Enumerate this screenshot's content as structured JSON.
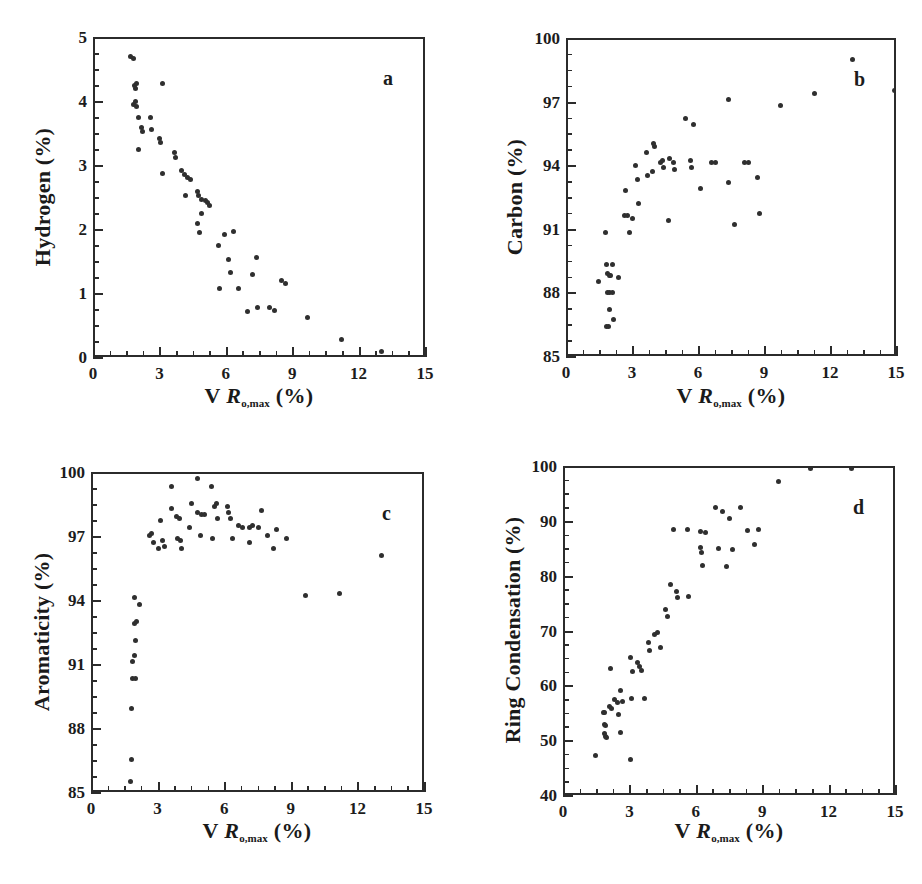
{
  "figure": {
    "panels": [
      {
        "letter": "a",
        "x_title_prefix": "V ",
        "x_title_symbol": "R",
        "x_title_sub": "o,max",
        "x_title_suffix": " (%)",
        "y_title": "Hydrogen (%)",
        "x_ticks": [
          "0",
          "3",
          "6",
          "9",
          "12",
          "15"
        ],
        "y_ticks": [
          "0",
          "1",
          "2",
          "3",
          "4",
          "5"
        ]
      },
      {
        "letter": "b",
        "x_title_prefix": "V ",
        "x_title_symbol": "R",
        "x_title_sub": "o,max",
        "x_title_suffix": " (%)",
        "y_title": "Carbon (%)",
        "x_ticks": [
          "0",
          "3",
          "6",
          "9",
          "12",
          "15"
        ],
        "y_ticks": [
          "85",
          "88",
          "91",
          "94",
          "97",
          "100"
        ]
      },
      {
        "letter": "c",
        "x_title_prefix": "V ",
        "x_title_symbol": "R",
        "x_title_sub": "o,max",
        "x_title_suffix": " (%)",
        "y_title": "Aromaticity (%)",
        "x_ticks": [
          "0",
          "3",
          "6",
          "9",
          "12",
          "15"
        ],
        "y_ticks": [
          "85",
          "88",
          "91",
          "94",
          "97",
          "100"
        ]
      },
      {
        "letter": "d",
        "x_title_prefix": "V ",
        "x_title_symbol": "R",
        "x_title_sub": "o,max",
        "x_title_suffix": " (%)",
        "y_title": "Ring Condensation (%)",
        "x_ticks": [
          "0",
          "3",
          "6",
          "9",
          "12",
          "15"
        ],
        "y_ticks": [
          "40",
          "50",
          "60",
          "70",
          "80",
          "90",
          "100"
        ]
      }
    ],
    "marker_color": "#2f2f2f",
    "axis_color": "#2b2b2b"
  },
  "chart_data": [
    {
      "type": "scatter",
      "panel": "a",
      "title": "",
      "xlabel": "V Ro,max (%)",
      "ylabel": "Hydrogen (%)",
      "xlim": [
        0,
        15
      ],
      "ylim": [
        0,
        5
      ],
      "xticks": [
        0,
        3,
        6,
        9,
        12,
        15
      ],
      "yticks": [
        0,
        1,
        2,
        3,
        4,
        5
      ],
      "x_minor_tick_step": 0.75,
      "y_minor_tick_step": 0.25,
      "grid": false,
      "legend": false,
      "points": [
        [
          1.62,
          4.72
        ],
        [
          1.75,
          4.7
        ],
        [
          1.8,
          4.28
        ],
        [
          1.82,
          4.22
        ],
        [
          1.86,
          4.3
        ],
        [
          3.05,
          4.3
        ],
        [
          1.72,
          3.97
        ],
        [
          1.82,
          4.02
        ],
        [
          1.88,
          3.95
        ],
        [
          1.95,
          3.78
        ],
        [
          2.52,
          3.77
        ],
        [
          2.1,
          3.62
        ],
        [
          2.55,
          3.58
        ],
        [
          2.15,
          3.55
        ],
        [
          2.92,
          3.45
        ],
        [
          2.96,
          3.38
        ],
        [
          1.95,
          3.28
        ],
        [
          3.6,
          3.22
        ],
        [
          3.62,
          3.15
        ],
        [
          3.05,
          2.9
        ],
        [
          3.92,
          2.95
        ],
        [
          4.05,
          2.88
        ],
        [
          4.18,
          2.83
        ],
        [
          4.32,
          2.8
        ],
        [
          4.65,
          2.62
        ],
        [
          4.68,
          2.55
        ],
        [
          4.1,
          2.55
        ],
        [
          4.82,
          2.5
        ],
        [
          5.0,
          2.48
        ],
        [
          5.1,
          2.44
        ],
        [
          5.18,
          2.4
        ],
        [
          4.8,
          2.28
        ],
        [
          4.62,
          2.12
        ],
        [
          4.72,
          1.98
        ],
        [
          5.85,
          1.95
        ],
        [
          6.28,
          2.0
        ],
        [
          5.58,
          1.78
        ],
        [
          6.05,
          1.55
        ],
        [
          7.28,
          1.58
        ],
        [
          6.1,
          1.35
        ],
        [
          7.12,
          1.32
        ],
        [
          8.42,
          1.22
        ],
        [
          8.62,
          1.18
        ],
        [
          5.62,
          1.1
        ],
        [
          6.5,
          1.1
        ],
        [
          6.9,
          0.75
        ],
        [
          7.32,
          0.8
        ],
        [
          7.9,
          0.8
        ],
        [
          8.1,
          0.76
        ],
        [
          9.62,
          0.65
        ],
        [
          11.15,
          0.3
        ],
        [
          12.95,
          0.12
        ]
      ]
    },
    {
      "type": "scatter",
      "panel": "b",
      "title": "",
      "xlabel": "V Ro,max (%)",
      "ylabel": "Carbon (%)",
      "xlim": [
        0,
        15
      ],
      "ylim": [
        85,
        100
      ],
      "xticks": [
        0,
        3,
        6,
        9,
        12,
        15
      ],
      "yticks": [
        85,
        88,
        91,
        94,
        97,
        100
      ],
      "x_minor_tick_step": 0.75,
      "y_minor_tick_step": 0.75,
      "grid": false,
      "legend": false,
      "points": [
        [
          1.4,
          88.6
        ],
        [
          1.72,
          90.9
        ],
        [
          1.75,
          89.4
        ],
        [
          2.0,
          89.4
        ],
        [
          1.8,
          89.0
        ],
        [
          1.88,
          88.9
        ],
        [
          1.95,
          88.9
        ],
        [
          1.78,
          88.1
        ],
        [
          1.9,
          88.1
        ],
        [
          2.0,
          88.1
        ],
        [
          1.88,
          87.3
        ],
        [
          1.75,
          86.5
        ],
        [
          1.85,
          86.5
        ],
        [
          2.05,
          86.8
        ],
        [
          2.3,
          88.8
        ],
        [
          2.55,
          91.7
        ],
        [
          2.7,
          91.7
        ],
        [
          2.92,
          91.6
        ],
        [
          2.62,
          92.9
        ],
        [
          2.8,
          90.9
        ],
        [
          3.05,
          94.1
        ],
        [
          3.15,
          93.4
        ],
        [
          3.2,
          92.3
        ],
        [
          3.55,
          94.7
        ],
        [
          3.62,
          93.6
        ],
        [
          3.82,
          93.8
        ],
        [
          3.9,
          95.1
        ],
        [
          3.95,
          95.0
        ],
        [
          4.2,
          94.2
        ],
        [
          4.28,
          94.3
        ],
        [
          4.35,
          94.0
        ],
        [
          4.62,
          94.4
        ],
        [
          4.78,
          94.2
        ],
        [
          4.85,
          93.9
        ],
        [
          4.55,
          91.5
        ],
        [
          5.35,
          96.3
        ],
        [
          5.55,
          94.3
        ],
        [
          5.7,
          96.0
        ],
        [
          5.6,
          94.0
        ],
        [
          6.0,
          93.0
        ],
        [
          6.52,
          94.2
        ],
        [
          6.7,
          94.2
        ],
        [
          7.3,
          97.2
        ],
        [
          7.3,
          93.3
        ],
        [
          7.55,
          91.3
        ],
        [
          8.0,
          94.2
        ],
        [
          8.2,
          94.2
        ],
        [
          8.62,
          93.5
        ],
        [
          8.72,
          91.8
        ],
        [
          9.65,
          96.9
        ],
        [
          11.2,
          97.5
        ],
        [
          12.95,
          99.1
        ],
        [
          14.85,
          97.6
        ]
      ]
    },
    {
      "type": "scatter",
      "panel": "c",
      "title": "",
      "xlabel": "V Ro,max (%)",
      "ylabel": "Aromaticity (%)",
      "xlim": [
        0,
        15
      ],
      "ylim": [
        85,
        100
      ],
      "xticks": [
        0,
        3,
        6,
        9,
        12,
        15
      ],
      "yticks": [
        85,
        88,
        91,
        94,
        97,
        100
      ],
      "x_minor_tick_step": 0.75,
      "y_minor_tick_step": 0.75,
      "grid": false,
      "legend": false,
      "points": [
        [
          1.7,
          85.6
        ],
        [
          1.72,
          86.6
        ],
        [
          1.75,
          89.0
        ],
        [
          1.78,
          90.4
        ],
        [
          1.92,
          90.4
        ],
        [
          1.8,
          91.2
        ],
        [
          1.85,
          91.5
        ],
        [
          1.9,
          92.2
        ],
        [
          1.88,
          93.0
        ],
        [
          1.95,
          93.1
        ],
        [
          1.85,
          94.2
        ],
        [
          2.1,
          93.9
        ],
        [
          2.55,
          97.1
        ],
        [
          2.62,
          97.2
        ],
        [
          2.72,
          96.8
        ],
        [
          2.95,
          96.5
        ],
        [
          3.05,
          97.8
        ],
        [
          3.15,
          96.9
        ],
        [
          3.22,
          96.6
        ],
        [
          3.52,
          99.4
        ],
        [
          3.55,
          98.4
        ],
        [
          3.78,
          98.0
        ],
        [
          3.88,
          97.9
        ],
        [
          3.82,
          97.0
        ],
        [
          3.92,
          96.9
        ],
        [
          3.98,
          96.5
        ],
        [
          4.45,
          98.6
        ],
        [
          4.35,
          97.5
        ],
        [
          4.7,
          99.8
        ],
        [
          4.72,
          98.2
        ],
        [
          4.9,
          98.1
        ],
        [
          5.0,
          98.1
        ],
        [
          4.82,
          97.1
        ],
        [
          5.35,
          99.4
        ],
        [
          5.48,
          98.5
        ],
        [
          5.55,
          98.6
        ],
        [
          5.6,
          97.9
        ],
        [
          5.38,
          97.0
        ],
        [
          6.05,
          98.5
        ],
        [
          6.1,
          98.2
        ],
        [
          6.18,
          97.9
        ],
        [
          6.3,
          97.0
        ],
        [
          6.55,
          97.6
        ],
        [
          6.72,
          97.5
        ],
        [
          7.05,
          97.5
        ],
        [
          7.2,
          97.6
        ],
        [
          7.05,
          96.8
        ],
        [
          7.6,
          98.3
        ],
        [
          7.45,
          97.5
        ],
        [
          7.85,
          97.1
        ],
        [
          8.25,
          97.4
        ],
        [
          8.15,
          96.5
        ],
        [
          8.7,
          97.0
        ],
        [
          9.55,
          94.3
        ],
        [
          11.1,
          94.4
        ],
        [
          13.0,
          96.2
        ]
      ]
    },
    {
      "type": "scatter",
      "panel": "d",
      "title": "",
      "xlabel": "V Ro,max (%)",
      "ylabel": "Ring Condensation (%)",
      "xlim": [
        0,
        15
      ],
      "ylim": [
        40,
        100
      ],
      "xticks": [
        0,
        3,
        6,
        9,
        12,
        15
      ],
      "yticks": [
        40,
        50,
        60,
        70,
        80,
        90,
        100
      ],
      "x_minor_tick_step": 0.75,
      "y_minor_tick_step": 2.5,
      "grid": false,
      "legend": false,
      "points": [
        [
          1.4,
          47.5
        ],
        [
          1.72,
          55.5
        ],
        [
          1.8,
          55.4
        ],
        [
          1.78,
          53.2
        ],
        [
          1.85,
          53.0
        ],
        [
          1.8,
          51.6
        ],
        [
          1.82,
          51.0
        ],
        [
          1.88,
          50.8
        ],
        [
          2.05,
          63.5
        ],
        [
          2.0,
          56.5
        ],
        [
          2.08,
          56.2
        ],
        [
          2.25,
          57.8
        ],
        [
          2.38,
          57.2
        ],
        [
          2.4,
          55.0
        ],
        [
          2.52,
          59.5
        ],
        [
          2.58,
          57.4
        ],
        [
          2.52,
          51.8
        ],
        [
          2.98,
          46.8
        ],
        [
          2.95,
          65.5
        ],
        [
          3.0,
          58.0
        ],
        [
          3.28,
          64.5
        ],
        [
          3.35,
          63.8
        ],
        [
          3.45,
          63.0
        ],
        [
          3.58,
          58.0
        ],
        [
          3.05,
          62.8
        ],
        [
          3.78,
          68.2
        ],
        [
          3.82,
          66.8
        ],
        [
          4.05,
          69.6
        ],
        [
          4.2,
          70.0
        ],
        [
          4.3,
          67.2
        ],
        [
          4.55,
          74.2
        ],
        [
          4.62,
          73.0
        ],
        [
          4.78,
          78.8
        ],
        [
          4.92,
          88.8
        ],
        [
          5.05,
          77.5
        ],
        [
          5.08,
          76.4
        ],
        [
          5.55,
          88.8
        ],
        [
          5.6,
          76.5
        ],
        [
          6.1,
          88.4
        ],
        [
          6.12,
          85.5
        ],
        [
          6.15,
          84.5
        ],
        [
          6.2,
          82.2
        ],
        [
          6.35,
          88.2
        ],
        [
          6.82,
          92.8
        ],
        [
          6.95,
          85.3
        ],
        [
          7.12,
          92.0
        ],
        [
          7.3,
          82.0
        ],
        [
          7.42,
          90.8
        ],
        [
          7.55,
          85.2
        ],
        [
          7.95,
          92.8
        ],
        [
          8.25,
          88.6
        ],
        [
          8.55,
          86.0
        ],
        [
          8.72,
          88.8
        ],
        [
          9.65,
          97.5
        ],
        [
          11.1,
          100.0
        ],
        [
          12.95,
          100.0
        ]
      ]
    }
  ],
  "caption": {
    "partial_text": ""
  }
}
